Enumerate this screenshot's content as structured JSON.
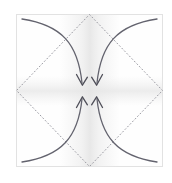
{
  "figure": {
    "kind": "origami-fold-diagram",
    "step_label_clipped": ")",
    "canvas": {
      "width": 172,
      "height": 183,
      "background": "#ffffff"
    },
    "paper": {
      "name": "square-sheet",
      "left": 16,
      "top": 14,
      "right": 163,
      "bottom": 167,
      "fill": "#fefefe",
      "border_color": "#e2e2e2",
      "border_width": 1
    },
    "shading": {
      "description": "soft vertical gray gradient through the vertical midline",
      "color": "#e9e9e9",
      "opacity": 0.75
    },
    "fold_lines": {
      "name": "dotted-diamond",
      "style": "dotted",
      "color": "#9a9aa2",
      "width": 1,
      "dash": "1 2.6",
      "vertices": [
        {
          "label": "top-midpoint",
          "x": 89.5,
          "y": 14
        },
        {
          "label": "right-midpoint",
          "x": 163,
          "y": 90.5
        },
        {
          "label": "bottom-midpoint",
          "x": 89.5,
          "y": 167
        },
        {
          "label": "left-midpoint",
          "x": 16,
          "y": 90.5
        }
      ]
    },
    "arrows": {
      "color": "#63636e",
      "width": 1.3,
      "head_color": "#4e4e58",
      "target": {
        "x": 89.5,
        "y": 90.5
      },
      "items": [
        {
          "name": "arrow-top-left-to-center",
          "from_corner": "top-left",
          "start": {
            "x": 22,
            "y": 19
          },
          "control": {
            "x": 74,
            "y": 26
          },
          "end": {
            "x": 82,
            "y": 84
          },
          "head_angle_deg": 72
        },
        {
          "name": "arrow-top-right-to-center",
          "from_corner": "top-right",
          "start": {
            "x": 157,
            "y": 19
          },
          "control": {
            "x": 105,
            "y": 26
          },
          "end": {
            "x": 97,
            "y": 84
          },
          "head_angle_deg": 108
        },
        {
          "name": "arrow-bottom-left-to-center",
          "from_corner": "bottom-left",
          "start": {
            "x": 22,
            "y": 162
          },
          "control": {
            "x": 74,
            "y": 155
          },
          "end": {
            "x": 82,
            "y": 98
          },
          "head_angle_deg": 288
        },
        {
          "name": "arrow-bottom-right-to-center",
          "from_corner": "bottom-right",
          "start": {
            "x": 157,
            "y": 162
          },
          "control": {
            "x": 105,
            "y": 155
          },
          "end": {
            "x": 97,
            "y": 98
          },
          "head_angle_deg": 252
        }
      ]
    }
  }
}
